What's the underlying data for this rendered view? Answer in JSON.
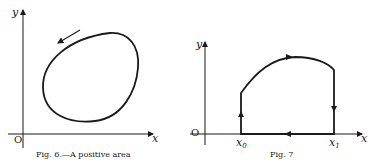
{
  "figures": [
    {
      "id": "fig6",
      "caption": "Fig. 6.—A positive area",
      "axes": {
        "x_label": "x",
        "y_label": "y",
        "origin_label": "O"
      },
      "curve": {
        "type": "closed-ellipse",
        "direction": "counterclockwise"
      }
    },
    {
      "id": "fig7",
      "caption": "Fig. 7",
      "axes": {
        "x_label": "x",
        "y_label": "y",
        "origin_label": "O"
      },
      "ticks": [
        {
          "label": "x",
          "sub": "0"
        },
        {
          "label": "x",
          "sub": "1"
        }
      ],
      "curve": {
        "type": "closed-region",
        "direction": "clockwise"
      }
    }
  ],
  "colors": {
    "ink": "#1a1a1a",
    "paper": "#ffffff"
  }
}
